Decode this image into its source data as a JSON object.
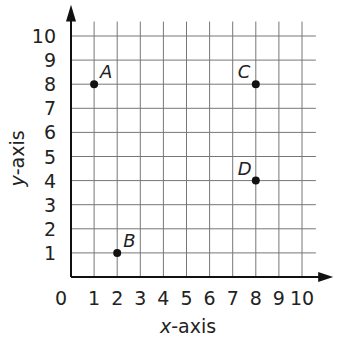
{
  "chart_data": {
    "type": "scatter",
    "title": "",
    "xlabel": "x-axis",
    "ylabel": "y-axis",
    "xlim": [
      0,
      10
    ],
    "ylim": [
      0,
      10
    ],
    "grid": true,
    "x_ticks": [
      "0",
      "1",
      "2",
      "3",
      "4",
      "5",
      "6",
      "7",
      "8",
      "9",
      "10"
    ],
    "y_ticks": [
      "1",
      "2",
      "3",
      "4",
      "5",
      "6",
      "7",
      "8",
      "9",
      "10"
    ],
    "points": [
      {
        "label": "A",
        "x": 1,
        "y": 8
      },
      {
        "label": "B",
        "x": 2,
        "y": 1
      },
      {
        "label": "C",
        "x": 8,
        "y": 8
      },
      {
        "label": "D",
        "x": 8,
        "y": 4
      }
    ]
  }
}
